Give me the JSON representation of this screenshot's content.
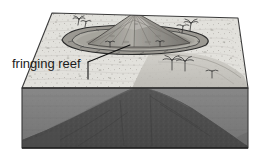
{
  "figure": {
    "caption_visible": false,
    "annotations": [
      {
        "id": "fringing-reef",
        "text": "fringing reef",
        "x": 12,
        "y": 68,
        "leader_from": [
          88,
          62
        ],
        "leader_to": [
          130,
          45
        ],
        "tick_from": [
          88,
          62
        ],
        "tick_to": [
          88,
          79
        ]
      }
    ],
    "colors": {
      "ocean_surface": "#dddcd7",
      "water_column": "#7f7f7f",
      "water_column_dark": "#6b6b6b",
      "seamount_dark": "#4a4a4a",
      "seamount_mid": "#5c5c5c",
      "island_light": "#b5b3ad",
      "island_mid": "#9a9892",
      "island_shadow": "#7d7b76",
      "reef_outline": "#2d2d2d",
      "lagoon": "#a8a6a0",
      "outline": "#3a3a3a",
      "text": "#1a1a1a",
      "background": "#ffffff",
      "shelf": "#c9c7c1"
    },
    "block": {
      "type": "isometric-block-diagram",
      "top_face": [
        [
          52,
          13
        ],
        [
          238,
          18
        ],
        [
          248,
          88
        ],
        [
          22,
          88
        ]
      ],
      "front_face": [
        [
          22,
          88
        ],
        [
          248,
          88
        ],
        [
          248,
          148
        ],
        [
          22,
          148
        ]
      ],
      "water_level_y": 88
    },
    "features": {
      "volcano_peak": [
        135,
        12
      ],
      "reef_ring_bounds": [
        62,
        27,
        146,
        24
      ],
      "lagoon_visible": true,
      "submerged_seamount_visible": true,
      "palm_trees": [
        {
          "x": 78,
          "y": 20
        },
        {
          "x": 190,
          "y": 24
        },
        {
          "x": 172,
          "y": 62
        },
        {
          "x": 184,
          "y": 62
        },
        {
          "x": 110,
          "y": 45
        }
      ]
    }
  }
}
